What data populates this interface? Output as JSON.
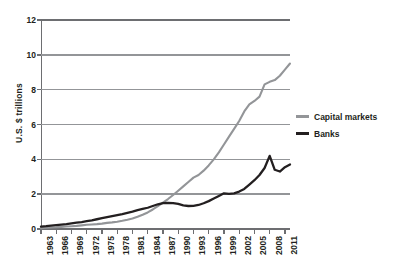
{
  "chart_data": {
    "type": "line",
    "title": "",
    "xlabel": "",
    "ylabel": "U.S. $ trillions",
    "ylim": [
      0,
      12
    ],
    "yticks": [
      0,
      2,
      4,
      6,
      8,
      10,
      12
    ],
    "xlim": [
      1963,
      2012
    ],
    "xticks": [
      1963,
      1966,
      1969,
      1972,
      1975,
      1978,
      1981,
      1984,
      1987,
      1990,
      1993,
      1996,
      1999,
      2002,
      2005,
      2008,
      2011
    ],
    "grid": true,
    "legend_position": "right",
    "colors": {
      "capital_markets": "#939598",
      "banks": "#231f20",
      "axis": "#6d6e71",
      "gridline": "#939598",
      "text": "#231f20",
      "background": "#ffffff"
    },
    "x": [
      1963,
      1964,
      1965,
      1966,
      1967,
      1968,
      1969,
      1970,
      1971,
      1972,
      1973,
      1974,
      1975,
      1976,
      1977,
      1978,
      1979,
      1980,
      1981,
      1982,
      1983,
      1984,
      1985,
      1986,
      1987,
      1988,
      1989,
      1990,
      1991,
      1992,
      1993,
      1994,
      1995,
      1996,
      1997,
      1998,
      1999,
      2000,
      2001,
      2002,
      2003,
      2004,
      2005,
      2006,
      2007,
      2008,
      2009,
      2010,
      2011,
      2012
    ],
    "series": [
      {
        "name": "Capital markets",
        "color": "#939598",
        "values": [
          0.05,
          0.07,
          0.09,
          0.1,
          0.12,
          0.14,
          0.16,
          0.18,
          0.21,
          0.24,
          0.26,
          0.28,
          0.31,
          0.35,
          0.38,
          0.42,
          0.47,
          0.53,
          0.6,
          0.7,
          0.82,
          0.95,
          1.12,
          1.32,
          1.52,
          1.72,
          1.95,
          2.2,
          2.45,
          2.7,
          2.95,
          3.1,
          3.35,
          3.65,
          4.0,
          4.4,
          4.85,
          5.3,
          5.75,
          6.2,
          6.75,
          7.15,
          7.35,
          7.6,
          8.3,
          8.45,
          8.55,
          8.8,
          9.15,
          9.5
        ]
      },
      {
        "name": "Banks",
        "color": "#231f20",
        "values": [
          0.14,
          0.16,
          0.19,
          0.22,
          0.25,
          0.28,
          0.32,
          0.36,
          0.4,
          0.45,
          0.5,
          0.56,
          0.62,
          0.68,
          0.74,
          0.8,
          0.86,
          0.93,
          1.0,
          1.08,
          1.15,
          1.22,
          1.32,
          1.42,
          1.48,
          1.5,
          1.49,
          1.44,
          1.36,
          1.32,
          1.33,
          1.38,
          1.48,
          1.6,
          1.75,
          1.9,
          2.05,
          2.02,
          2.05,
          2.15,
          2.3,
          2.55,
          2.8,
          3.1,
          3.5,
          4.2,
          3.4,
          3.3,
          3.55,
          3.7
        ]
      }
    ]
  },
  "legend": {
    "items": [
      {
        "label": "Capital markets",
        "color": "#939598"
      },
      {
        "label": "Banks",
        "color": "#231f20"
      }
    ]
  }
}
